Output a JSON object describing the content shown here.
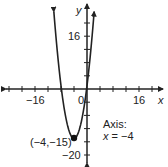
{
  "chart_data": {
    "type": "line",
    "title": "",
    "function": "y = x^2 + 8x + 1",
    "xlabel": "x",
    "ylabel": "y",
    "xlim": [
      -26,
      24
    ],
    "ylim": [
      -22,
      24
    ],
    "x_tick_step": 4,
    "y_tick_step": 4,
    "x_tick_labels": [
      {
        "value": -16,
        "label": "−16"
      },
      {
        "value": 0,
        "label": "0"
      },
      {
        "value": 16,
        "label": "16"
      }
    ],
    "y_tick_labels": [
      {
        "value": 16,
        "label": "16"
      },
      {
        "value": -20,
        "label": "−20"
      }
    ],
    "grid": false,
    "vertex": {
      "x": -4,
      "y": -15,
      "label": "(−4,−15)"
    },
    "annotations": [
      {
        "text_line1": "Axis:",
        "text_line2": "x = −4"
      }
    ],
    "series": [
      {
        "name": "parabola",
        "vertex": [
          -4,
          -15
        ],
        "a": 1,
        "x_range": [
          -10.2,
          2.2
        ]
      }
    ]
  },
  "labels": {
    "x_axis": "x",
    "y_axis": "y",
    "tick_neg16": "−16",
    "tick_0": "0",
    "tick_16_x": "16",
    "tick_16_y": "16",
    "tick_neg20": "−20",
    "vertex": "(−4,−15)",
    "axis_title": "Axis:",
    "axis_eq_var": "x",
    "axis_eq_rest": " = −4"
  }
}
